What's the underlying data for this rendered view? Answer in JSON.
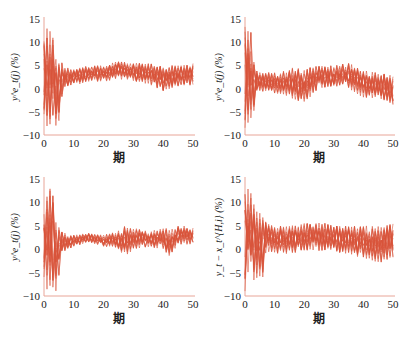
{
  "figure": {
    "line_color": "#d9533a",
    "axis_color": "#e8a598",
    "caption": ""
  },
  "chart_data": [
    {
      "type": "line",
      "panel": "top-left",
      "title": "",
      "xlabel": "期",
      "ylabel": "y^e_t(j) (%)",
      "xlim": [
        0,
        50
      ],
      "ylim": [
        -10,
        15
      ],
      "xticks": [
        0,
        10,
        20,
        30,
        40,
        50
      ],
      "yticks": [
        -10,
        -5,
        0,
        5,
        10,
        15
      ],
      "grid": false,
      "legend": null,
      "description": "Many overlapping agent expectation paths; large oscillation ±(−9..14) in periods 0–7, then converging to a band of about 1–5% for periods 8–50, with a dip near period 40.",
      "series_envelope": {
        "x": [
          0,
          1,
          2,
          3,
          4,
          5,
          6,
          7,
          8,
          10,
          12,
          15,
          20,
          25,
          30,
          35,
          40,
          45,
          50
        ],
        "upper": [
          13,
          14,
          13,
          12,
          7,
          7,
          6,
          5,
          4.5,
          4.5,
          4.5,
          5,
          5,
          6,
          5.5,
          5.5,
          5,
          5,
          5.5
        ],
        "lower": [
          -8,
          -9,
          -8.5,
          -8,
          -8,
          -8,
          -2,
          0,
          0.5,
          1,
          1,
          1.5,
          1.5,
          2,
          1.5,
          1,
          -0.5,
          0.5,
          0.5
        ]
      }
    },
    {
      "type": "line",
      "panel": "top-right",
      "title": "",
      "xlabel": "期",
      "ylabel": "y^e_t(j) (%)",
      "xlim": [
        0,
        50
      ],
      "ylim": [
        -10,
        15
      ],
      "xticks": [
        0,
        10,
        20,
        30,
        40,
        50
      ],
      "yticks": [
        -10,
        -5,
        0,
        5,
        10,
        15
      ],
      "grid": false,
      "legend": null,
      "description": "Large initial spike up to ~14 and down to ~−9 in periods 0–4, then a band around −1..4% that widens to about −3..5% over periods 10–50.",
      "series_envelope": {
        "x": [
          0,
          1,
          2,
          3,
          4,
          5,
          8,
          10,
          15,
          20,
          25,
          30,
          35,
          40,
          45,
          50
        ],
        "upper": [
          14,
          14,
          13,
          6,
          4,
          3.5,
          3.5,
          3.5,
          4.5,
          4.5,
          5,
          5,
          5.5,
          4,
          3.5,
          3
        ],
        "lower": [
          -9,
          -9,
          -8,
          -5,
          -1,
          -1,
          -0.5,
          -1,
          -2,
          -3,
          0,
          0.5,
          0,
          -2,
          -2,
          -3.5
        ]
      }
    },
    {
      "type": "line",
      "panel": "bottom-left",
      "title": "",
      "xlabel": "期",
      "ylabel": "y^e_t(j) (%)",
      "xlim": [
        0,
        50
      ],
      "ylim": [
        -10,
        15
      ],
      "xticks": [
        0,
        10,
        20,
        30,
        40,
        50
      ],
      "yticks": [
        -10,
        -5,
        0,
        5,
        10,
        15
      ],
      "grid": false,
      "legend": null,
      "description": "Initial oscillation up to ~14 and down to ~−9 in periods 0–6, converging to ~1–3% by period 15, then band 0–5% with dips near periods 26 and 42.",
      "series_envelope": {
        "x": [
          0,
          1,
          2,
          3,
          4,
          5,
          6,
          8,
          10,
          15,
          20,
          25,
          27,
          30,
          35,
          40,
          42,
          45,
          50
        ],
        "upper": [
          14,
          14,
          13,
          12,
          6,
          5,
          4,
          3,
          3,
          3.5,
          3,
          4,
          5,
          4.5,
          4,
          4.5,
          4.5,
          5,
          5
        ],
        "lower": [
          -9,
          -9,
          -9,
          -9,
          -9,
          -6,
          -1,
          0,
          0.5,
          1.5,
          0.5,
          0,
          -2,
          0,
          0.5,
          0,
          -1.5,
          1,
          1
        ]
      }
    },
    {
      "type": "line",
      "panel": "bottom-right",
      "title": "",
      "xlabel": "期",
      "ylabel": "y_t − x_t^{H,i} (%)",
      "xlim": [
        0,
        50
      ],
      "ylim": [
        -10,
        15
      ],
      "xticks": [
        0,
        10,
        20,
        30,
        40,
        50
      ],
      "yticks": [
        -10,
        -5,
        0,
        5,
        10,
        15
      ],
      "grid": false,
      "legend": null,
      "description": "Initial oscillation 14 to −9 during periods 0–7, then a band of about −1..6% to period 50, slightly widening after period 40.",
      "series_envelope": {
        "x": [
          0,
          1,
          2,
          3,
          4,
          5,
          6,
          7,
          8,
          10,
          15,
          20,
          25,
          30,
          35,
          40,
          45,
          50
        ],
        "upper": [
          14,
          14,
          12,
          10,
          9,
          8,
          7,
          6,
          5.5,
          5,
          5,
          5.5,
          6,
          5,
          5,
          5,
          5,
          5.5
        ],
        "lower": [
          -9,
          -8,
          -7,
          -7,
          -6.5,
          -6.5,
          -6.5,
          -1,
          -1,
          -1,
          -1,
          -0.5,
          -0.5,
          -0.5,
          -1,
          -2,
          -3,
          -2
        ]
      }
    }
  ]
}
